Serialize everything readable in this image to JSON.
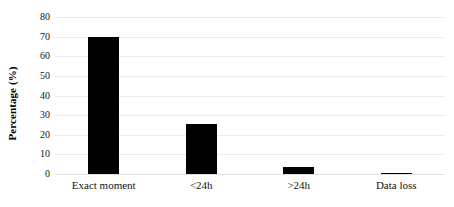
{
  "chart_data": {
    "type": "bar",
    "title": "",
    "xlabel": "",
    "ylabel": "Percentage (%)",
    "categories": [
      "Exact moment",
      "<24h",
      ">24h",
      "Data loss"
    ],
    "values": [
      70,
      25.3,
      3.5,
      0.4
    ],
    "ylim": [
      0,
      80
    ],
    "yticks": [
      0,
      10,
      20,
      30,
      40,
      50,
      60,
      70,
      80
    ],
    "ytick_labels": [
      "0",
      "10",
      "20",
      "30",
      "40",
      "50",
      "60",
      "70",
      "80"
    ],
    "grid": true,
    "legend": false,
    "legend_position": "none",
    "bar_color": "#000000",
    "gridline_color": "#ECECED",
    "background_color": "#FFFFFF",
    "text_color": "#111111"
  }
}
